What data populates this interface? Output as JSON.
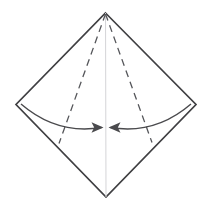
{
  "diagram": {
    "type": "origami-fold-instruction",
    "canvas": {
      "width": 212,
      "height": 212,
      "background": "#ffffff"
    },
    "colors": {
      "outline": "#3f3f42",
      "dashed_fold": "#55565a",
      "center_crease": "#d5d5d8",
      "arrow": "#4a4a4d",
      "background": "#ffffff"
    },
    "stroke_widths": {
      "outline": 1.7,
      "dashed_fold": 1.3,
      "center_crease": 1.0,
      "arc": 1.4
    },
    "dash_pattern": "7 5",
    "vertices": {
      "top": {
        "x": 105.5,
        "y": 13
      },
      "left": {
        "x": 16,
        "y": 104.5
      },
      "right": {
        "x": 196,
        "y": 104.5
      },
      "bottom": {
        "x": 106,
        "y": 197
      }
    },
    "sheet_outline_path": "M 105.5 13 L 196 104.5 L 106 197 L 16 104.5 Z",
    "center_crease": {
      "label": "vertical-center-crease",
      "from": {
        "x": 105.5,
        "y": 13
      },
      "to": {
        "x": 106,
        "y": 197
      }
    },
    "fold_lines": [
      {
        "label": "left-fold-line",
        "style": "dashed",
        "from": {
          "x": 105.5,
          "y": 14
        },
        "to": {
          "x": 59,
          "y": 143.5
        }
      },
      {
        "label": "right-fold-line",
        "style": "dashed",
        "from": {
          "x": 105.5,
          "y": 14
        },
        "to": {
          "x": 152,
          "y": 142.5
        }
      }
    ],
    "arrows": [
      {
        "label": "left-fold-arrow",
        "direction": "right",
        "description": "curved arrow from left vertex sweeping to center crease",
        "path": "M 21 104 Q 57 135 101.5 127.5",
        "tip": {
          "x": 103,
          "y": 127.5
        },
        "head_points": "103.5,127.5 91.5,122.2 94.2,127.5 91.5,132.8"
      },
      {
        "label": "right-fold-arrow",
        "direction": "left",
        "description": "curved arrow from right vertex sweeping to center crease",
        "path": "M 191 104 Q 155 135 110.5 127.5",
        "tip": {
          "x": 109,
          "y": 127.5
        },
        "head_points": "108.5,127.5 120.5,122.2 117.8,127.5 120.5,132.8"
      }
    ]
  }
}
